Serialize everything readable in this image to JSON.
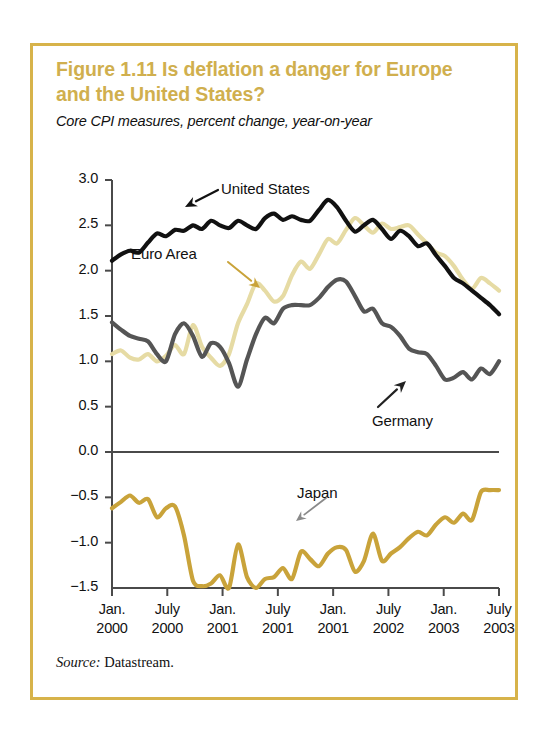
{
  "figure": {
    "title": "Figure 1.11  Is deflation a danger for Europe and the United States?",
    "subtitle": "Core CPI measures, percent change, year-on-year",
    "source_label": "Source:",
    "source_text": " Datastream.",
    "frame_color": "#d7b34a",
    "title_color": "#d0af4e"
  },
  "chart_data": {
    "type": "line",
    "title": "Figure 1.11  Is deflation a danger for Europe and the United States?",
    "subtitle": "Core CPI measures, percent change, year-on-year",
    "xlabel": "",
    "ylabel": "",
    "ylim": [
      -1.5,
      3.0
    ],
    "yticks": [
      3.0,
      2.5,
      2.0,
      1.5,
      1.0,
      0.5,
      0.0,
      -0.5,
      -1.0,
      -1.5
    ],
    "ytick_labels": [
      "3.0",
      "2.5",
      "2.0",
      "1.5",
      "1.0",
      "0.5",
      "0.0",
      "−0.5",
      "−1.0",
      "−1.5"
    ],
    "xtick_labels": [
      {
        "month": "Jan.",
        "year": "2000"
      },
      {
        "month": "July",
        "year": "2000"
      },
      {
        "month": "Jan.",
        "year": "2001"
      },
      {
        "month": "July",
        "year": "2001"
      },
      {
        "month": "Jan.",
        "year": "2001"
      },
      {
        "month": "July",
        "year": "2002"
      },
      {
        "month": "Jan.",
        "year": "2003"
      },
      {
        "month": "July",
        "year": "2003"
      }
    ],
    "grid": false,
    "legend": "inline-annotations",
    "zero_line": true,
    "x_start_month": 0,
    "x_end_month": 43,
    "series": [
      {
        "name": "United States",
        "color": "#111111",
        "width": 4.2,
        "values": [
          2.11,
          2.18,
          2.22,
          2.2,
          2.31,
          2.41,
          2.38,
          2.45,
          2.44,
          2.5,
          2.46,
          2.55,
          2.5,
          2.47,
          2.55,
          2.5,
          2.46,
          2.58,
          2.63,
          2.56,
          2.6,
          2.56,
          2.55,
          2.67,
          2.78,
          2.7,
          2.55,
          2.43,
          2.5,
          2.56,
          2.46,
          2.35,
          2.44,
          2.38,
          2.27,
          2.3,
          2.17,
          2.05,
          1.92,
          1.86,
          1.78,
          1.7,
          1.62,
          1.52
        ]
      },
      {
        "name": "Euro Area",
        "color": "#e6dba4",
        "width": 4.2,
        "values": [
          1.08,
          1.12,
          1.04,
          1.02,
          1.08,
          1.0,
          1.06,
          1.18,
          1.08,
          1.4,
          1.16,
          1.04,
          0.95,
          1.08,
          1.42,
          1.63,
          1.86,
          1.78,
          1.66,
          1.72,
          1.95,
          2.1,
          2.02,
          2.18,
          2.35,
          2.3,
          2.45,
          2.58,
          2.5,
          2.42,
          2.52,
          2.46,
          2.48,
          2.5,
          2.4,
          2.3,
          2.2,
          2.16,
          2.05,
          1.9,
          1.8,
          1.92,
          1.86,
          1.78
        ]
      },
      {
        "name": "Germany",
        "color": "#555555",
        "width": 4.2,
        "values": [
          1.43,
          1.35,
          1.28,
          1.25,
          1.22,
          1.08,
          1.0,
          1.3,
          1.42,
          1.28,
          1.05,
          1.2,
          1.16,
          0.98,
          0.72,
          1.02,
          1.3,
          1.48,
          1.42,
          1.58,
          1.62,
          1.62,
          1.62,
          1.7,
          1.82,
          1.9,
          1.88,
          1.72,
          1.55,
          1.58,
          1.42,
          1.38,
          1.28,
          1.14,
          1.1,
          1.08,
          0.95,
          0.8,
          0.82,
          0.88,
          0.8,
          0.92,
          0.86,
          1.0
        ]
      },
      {
        "name": "Japan",
        "color": "#c9a33a",
        "width": 4.2,
        "values": [
          -0.62,
          -0.55,
          -0.48,
          -0.56,
          -0.52,
          -0.72,
          -0.62,
          -0.6,
          -0.92,
          -1.42,
          -1.48,
          -1.45,
          -1.36,
          -1.5,
          -1.02,
          -1.38,
          -1.5,
          -1.4,
          -1.38,
          -1.28,
          -1.4,
          -1.1,
          -1.18,
          -1.26,
          -1.12,
          -1.05,
          -1.08,
          -1.32,
          -1.2,
          -0.9,
          -1.2,
          -1.12,
          -1.05,
          -0.95,
          -0.88,
          -0.92,
          -0.8,
          -0.72,
          -0.78,
          -0.68,
          -0.75,
          -0.44,
          -0.42,
          -0.42
        ]
      }
    ],
    "annotations": [
      {
        "text": "United States",
        "series": "United States",
        "color": "#111111"
      },
      {
        "text": "Euro Area",
        "series": "Euro Area",
        "color": "#c9a33a"
      },
      {
        "text": "Germany",
        "series": "Germany",
        "color": "#333333"
      },
      {
        "text": "Japan",
        "series": "Japan",
        "color": "#8a8a8a"
      }
    ]
  }
}
